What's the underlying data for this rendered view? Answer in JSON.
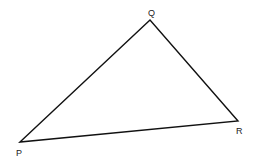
{
  "diagram": {
    "type": "triangle",
    "vertices": [
      {
        "name": "P",
        "x": 20,
        "y": 142,
        "label_x": 18,
        "label_y": 156
      },
      {
        "name": "Q",
        "x": 150,
        "y": 20,
        "label_x": 148,
        "label_y": 16
      },
      {
        "name": "R",
        "x": 238,
        "y": 121,
        "label_x": 237,
        "label_y": 134
      }
    ],
    "edges": [
      [
        "P",
        "Q"
      ],
      [
        "Q",
        "R"
      ],
      [
        "R",
        "P"
      ]
    ],
    "stroke_color": "#111111",
    "labels": {
      "P": "P",
      "Q": "Q",
      "R": "R"
    }
  }
}
